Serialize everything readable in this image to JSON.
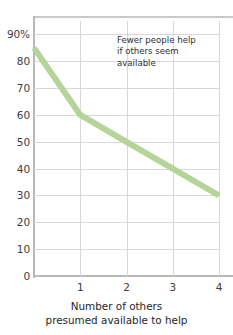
{
  "chart_data": {
    "type": "line",
    "title": "",
    "subtitle": "",
    "xlabel_line1": "Number of others",
    "xlabel_line2": "presumed available to help",
    "ylabel": "Percentage who help",
    "x": [
      0,
      1,
      2,
      3,
      4
    ],
    "values": [
      85,
      60,
      50,
      40,
      30
    ],
    "series": [
      {
        "name": "Percentage who help",
        "values": [
          85,
          60,
          50,
          40,
          30
        ],
        "color": "#b5d49a"
      }
    ],
    "categories": [
      "0",
      "1",
      "2",
      "3",
      "4"
    ],
    "xlim": [
      0,
      4
    ],
    "ylim": [
      0,
      95
    ],
    "xticks": [
      1,
      2,
      3,
      4
    ],
    "xticklabels": [
      "1",
      "2",
      "3",
      "4"
    ],
    "yticks": [
      0,
      10,
      20,
      30,
      40,
      50,
      60,
      70,
      80,
      90
    ],
    "yticklabels": [
      "0",
      "10",
      "20",
      "30",
      "40",
      "50",
      "60",
      "70",
      "80",
      "90%"
    ],
    "grid": true,
    "legend": false,
    "legend_position": "none",
    "annotations": [
      {
        "name": "callout",
        "line1": "Fewer people help",
        "line2": "if others seem",
        "line3": "available",
        "x": 1.75,
        "y": 88
      }
    ]
  },
  "colors": {
    "line": "#b5d49a",
    "grid": "#d8d8d8",
    "axis": "#b9b9b9",
    "text": "#3d3d3d",
    "background": "#ffffff"
  }
}
